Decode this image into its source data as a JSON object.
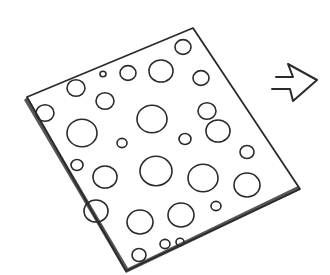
{
  "illustration": {
    "description": "Hand-drawn sketch of a tilted sheet perforated with circular holes, with an outlined arrow pointing right",
    "colors": {
      "ink": "#2a2a2a",
      "paper": "#ffffff",
      "shadow": "#3a3a3a"
    },
    "sheet": {
      "corners": [
        [
          27,
          97
        ],
        [
          193,
          28
        ],
        [
          300,
          189
        ],
        [
          126,
          271
        ]
      ]
    },
    "holes": [
      [
        183,
        47,
        8
      ],
      [
        103,
        74,
        3
      ],
      [
        128,
        73,
        8
      ],
      [
        161,
        71,
        12
      ],
      [
        76,
        88,
        9
      ],
      [
        105,
        101,
        9
      ],
      [
        152,
        119,
        15
      ],
      [
        201,
        78,
        8
      ],
      [
        207,
        111,
        9
      ],
      [
        45,
        113,
        9
      ],
      [
        82,
        133,
        15
      ],
      [
        122,
        143,
        5
      ],
      [
        185,
        139,
        6
      ],
      [
        218,
        131,
        12
      ],
      [
        247,
        152,
        7
      ],
      [
        77,
        165,
        6
      ],
      [
        105,
        177,
        12
      ],
      [
        156,
        171,
        16
      ],
      [
        203,
        178,
        15
      ],
      [
        247,
        185,
        13
      ],
      [
        96,
        211,
        12
      ],
      [
        140,
        222,
        13
      ],
      [
        181,
        215,
        13
      ],
      [
        216,
        206,
        5
      ],
      [
        165,
        244,
        5
      ],
      [
        139,
        255,
        7
      ],
      [
        180,
        242,
        4
      ]
    ],
    "arrow": {
      "direction": "right",
      "points": "276,77 293,77 288,64 317,80 293,101 290,89 272,89"
    }
  }
}
